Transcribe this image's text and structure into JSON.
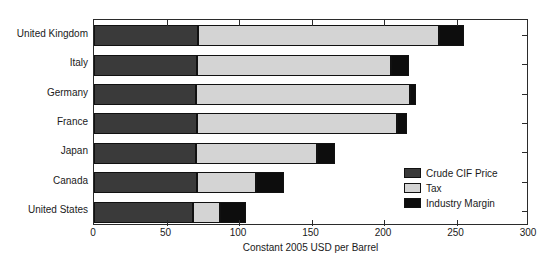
{
  "chart_data": {
    "type": "bar",
    "orientation": "horizontal",
    "stacked": true,
    "title": "",
    "xlabel": "Constant 2005 USD per Barrel",
    "ylabel": "",
    "xlim": [
      0,
      300
    ],
    "xticks": [
      0,
      50,
      100,
      150,
      200,
      250,
      300
    ],
    "xtick_labels": [
      "0",
      "50",
      "100",
      "150",
      "200",
      "250",
      "300"
    ],
    "grid": false,
    "legend_position": "center-right-inside",
    "categories": [
      "United Kingdom",
      "Italy",
      "Germany",
      "France",
      "Japan",
      "Canada",
      "United States"
    ],
    "series": [
      {
        "name": "Crude CIF Price",
        "color": "#3a3a3a",
        "values": [
          72,
          71,
          70,
          71,
          70,
          71,
          68
        ]
      },
      {
        "name": "Tax",
        "color": "#d4d4d4",
        "values": [
          166,
          134,
          148,
          138,
          84,
          41,
          19
        ]
      },
      {
        "name": "Industry Margin",
        "color": "#0d0d0d",
        "values": [
          17,
          12,
          4,
          7,
          12,
          19,
          18
        ]
      }
    ],
    "totals": [
      255,
      217,
      222,
      216,
      166,
      131,
      105
    ]
  },
  "legend": {
    "items": [
      {
        "label": "Crude CIF Price",
        "color": "#3a3a3a"
      },
      {
        "label": "Tax",
        "color": "#d4d4d4"
      },
      {
        "label": "Industry Margin",
        "color": "#0d0d0d"
      }
    ]
  },
  "axis": {
    "x_title": "Constant 2005 USD per Barrel",
    "x_tick_labels": [
      "0",
      "50",
      "100",
      "150",
      "200",
      "250",
      "300"
    ],
    "y_tick_labels": [
      "United Kingdom",
      "Italy",
      "Germany",
      "France",
      "Japan",
      "Canada",
      "United States"
    ]
  }
}
